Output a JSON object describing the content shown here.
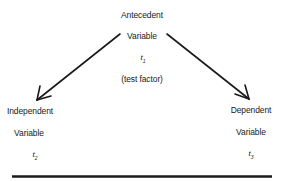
{
  "diagram": {
    "top_node": {
      "line1": "Antecedent",
      "line2": "Variable",
      "symbol": "t",
      "subscript": "1",
      "note": "(test factor)"
    },
    "left_node": {
      "line1": "Independent",
      "line2": "Variable",
      "symbol": "t",
      "subscript": "2"
    },
    "right_node": {
      "line1": "Dependent",
      "line2": "Variable",
      "symbol": "t",
      "subscript": "3"
    },
    "edges": [
      {
        "from": "top_node",
        "to": "left_node"
      },
      {
        "from": "top_node",
        "to": "right_node"
      }
    ],
    "colors": {
      "line": "#1a1a1a",
      "background": "#ffffff"
    }
  }
}
